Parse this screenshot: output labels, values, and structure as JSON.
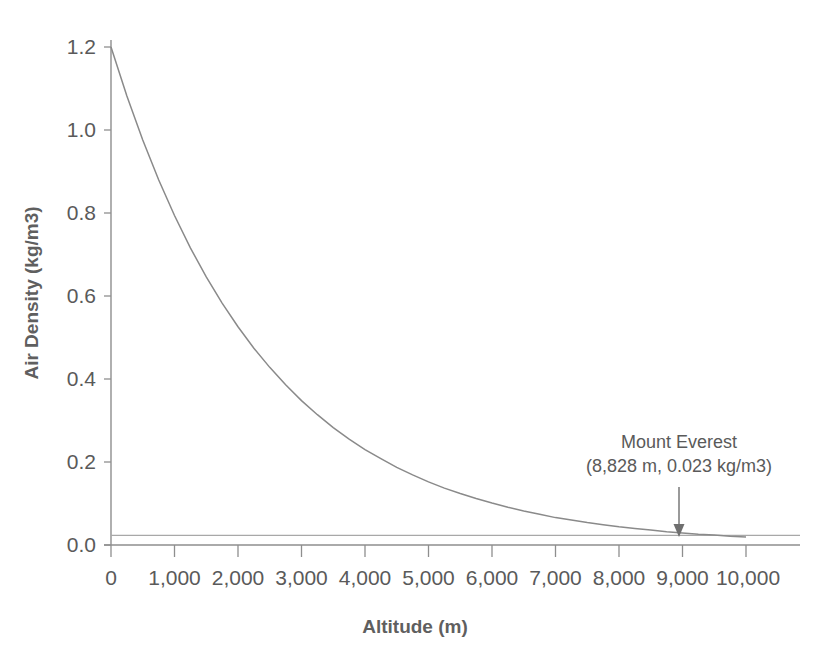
{
  "chart_data": {
    "type": "line",
    "title": "",
    "xlabel": "Altitude (m)",
    "ylabel": "Air Density (kg/m3)",
    "xlim": [
      0,
      10000
    ],
    "ylim": [
      0.0,
      1.2
    ],
    "grid": false,
    "legend": "none",
    "x_tick_labels": [
      "0",
      "1,000",
      "2,000",
      "3,000",
      "4,000",
      "5,000",
      "6,000",
      "7,000",
      "8,000",
      "9,000",
      "10,000"
    ],
    "x_tick_values": [
      0,
      1000,
      2000,
      3000,
      4000,
      5000,
      6000,
      7000,
      8000,
      9000,
      10000
    ],
    "y_tick_labels": [
      "0.0",
      "0.2",
      "0.4",
      "0.6",
      "0.8",
      "1.0",
      "1.2"
    ],
    "y_tick_values": [
      0.0,
      0.2,
      0.4,
      0.6,
      0.8,
      1.0,
      1.2
    ],
    "series": [
      {
        "name": "Air density vs altitude",
        "color": "#8a8a8a",
        "x": [
          0,
          250,
          500,
          750,
          1000,
          1250,
          1500,
          1750,
          2000,
          2250,
          2500,
          2750,
          3000,
          3250,
          3500,
          3750,
          4000,
          4250,
          4500,
          4750,
          5000,
          5250,
          5500,
          5750,
          6000,
          6250,
          6500,
          6750,
          7000,
          7250,
          7500,
          7750,
          8000,
          8250,
          8500,
          8750,
          9000,
          9250,
          9500,
          9750,
          10000
        ],
        "values": [
          1.2,
          1.082,
          0.976,
          0.88,
          0.794,
          0.716,
          0.646,
          0.583,
          0.526,
          0.474,
          0.428,
          0.386,
          0.348,
          0.314,
          0.283,
          0.255,
          0.23,
          0.208,
          0.187,
          0.169,
          0.152,
          0.137,
          0.124,
          0.112,
          0.101,
          0.091,
          0.082,
          0.074,
          0.066,
          0.06,
          0.054,
          0.049,
          0.044,
          0.04,
          0.036,
          0.032,
          0.029,
          0.026,
          0.024,
          0.021,
          0.019
        ]
      },
      {
        "name": "Mount Everest density reference line",
        "color": "#a8a8a8",
        "constant_y": 0.023
      }
    ],
    "annotations": [
      {
        "name": "mount-everest",
        "line1": "Mount Everest",
        "line2": "(8,828 m, 0.023 kg/m3)",
        "point_x": 8828,
        "point_y": 0.023
      }
    ]
  }
}
